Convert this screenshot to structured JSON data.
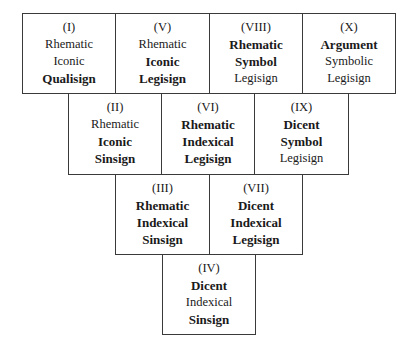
{
  "diagram": {
    "boxes": [
      {
        "id": "I",
        "numeral": "(I)",
        "lines": [
          {
            "t": "Rhematic",
            "b": false
          },
          {
            "t": "Iconic",
            "b": false
          },
          {
            "t": "Qualisign",
            "b": true
          }
        ],
        "x": 22,
        "y": 13,
        "w": 94,
        "h": 81
      },
      {
        "id": "V",
        "numeral": "(V)",
        "lines": [
          {
            "t": "Rhematic",
            "b": false
          },
          {
            "t": "Iconic",
            "b": true
          },
          {
            "t": "Legisign",
            "b": true
          }
        ],
        "x": 115,
        "y": 13,
        "w": 95,
        "h": 81
      },
      {
        "id": "VIII",
        "numeral": "(VIII)",
        "lines": [
          {
            "t": "Rhematic",
            "b": true
          },
          {
            "t": "Symbol",
            "b": true
          },
          {
            "t": "Legisign",
            "b": false
          }
        ],
        "x": 209,
        "y": 13,
        "w": 94,
        "h": 81
      },
      {
        "id": "X",
        "numeral": "(X)",
        "lines": [
          {
            "t": "Argument",
            "b": true
          },
          {
            "t": "Symbolic",
            "b": false
          },
          {
            "t": "Legisign",
            "b": false
          }
        ],
        "x": 302,
        "y": 13,
        "w": 94,
        "h": 81
      },
      {
        "id": "II",
        "numeral": "(II)",
        "lines": [
          {
            "t": "Rhematic",
            "b": false
          },
          {
            "t": "Iconic",
            "b": true
          },
          {
            "t": "Sinsign",
            "b": true
          }
        ],
        "x": 68,
        "y": 93,
        "w": 94,
        "h": 82
      },
      {
        "id": "VI",
        "numeral": "(VI)",
        "lines": [
          {
            "t": "Rhematic",
            "b": true
          },
          {
            "t": "Indexical",
            "b": true
          },
          {
            "t": "Legisign",
            "b": true
          }
        ],
        "x": 161,
        "y": 93,
        "w": 94,
        "h": 82
      },
      {
        "id": "IX",
        "numeral": "(IX)",
        "lines": [
          {
            "t": "Dicent",
            "b": true
          },
          {
            "t": "Symbol",
            "b": true
          },
          {
            "t": "Legisign",
            "b": false
          }
        ],
        "x": 254,
        "y": 93,
        "w": 95,
        "h": 82
      },
      {
        "id": "III",
        "numeral": "(III)",
        "lines": [
          {
            "t": "Rhematic",
            "b": true
          },
          {
            "t": "Indexical",
            "b": true
          },
          {
            "t": "Sinsign",
            "b": true
          }
        ],
        "x": 115,
        "y": 174,
        "w": 95,
        "h": 81
      },
      {
        "id": "VII",
        "numeral": "(VII)",
        "lines": [
          {
            "t": "Dicent",
            "b": true
          },
          {
            "t": "Indexical",
            "b": true
          },
          {
            "t": "Legisign",
            "b": true
          }
        ],
        "x": 209,
        "y": 174,
        "w": 94,
        "h": 81
      },
      {
        "id": "IV",
        "numeral": "(IV)",
        "lines": [
          {
            "t": "Dicent",
            "b": true
          },
          {
            "t": "Indexical",
            "b": false
          },
          {
            "t": "Sinsign",
            "b": true
          }
        ],
        "x": 162,
        "y": 254,
        "w": 94,
        "h": 81
      }
    ]
  }
}
